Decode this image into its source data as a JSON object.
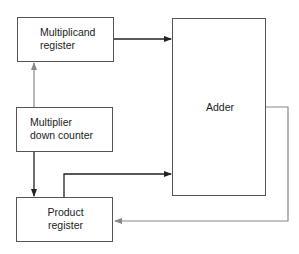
{
  "diagram": {
    "blocks": [
      {
        "id": "multiplicand",
        "lines": [
          "Multiplicand",
          "register"
        ]
      },
      {
        "id": "multiplier",
        "lines": [
          "Multiplier",
          "down counter"
        ]
      },
      {
        "id": "product",
        "lines": [
          "Product",
          "register"
        ]
      },
      {
        "id": "adder",
        "lines": [
          "Adder"
        ]
      }
    ],
    "connections": [
      {
        "from": "multiplicand",
        "to": "adder",
        "style": "dark"
      },
      {
        "from": "multiplier",
        "to": "multiplicand",
        "style": "gray"
      },
      {
        "from": "multiplier",
        "to": "product",
        "style": "dark"
      },
      {
        "from": "product",
        "to": "adder",
        "style": "dark"
      },
      {
        "from": "adder",
        "to": "product",
        "style": "gray",
        "note": "feedback"
      }
    ],
    "colors": {
      "dark": "#222222",
      "gray": "#888888",
      "box": "#555555"
    }
  }
}
